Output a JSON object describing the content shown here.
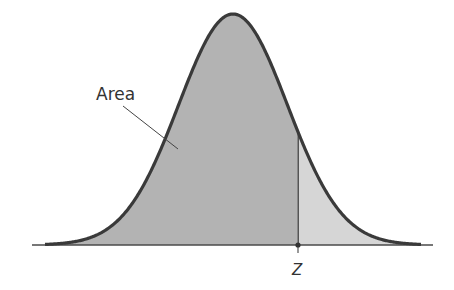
{
  "figure": {
    "type": "normal-distribution-diagram",
    "labels": {
      "area": "Area",
      "z": "Z"
    },
    "colors": {
      "curve": "#3a3a3a",
      "area_fill": "#b3b3b3",
      "tail_fill": "#d6d6d6",
      "axis": "#4a4a4a",
      "background": "#ffffff"
    }
  },
  "chart_data": {
    "type": "area",
    "title": "",
    "xlabel": "",
    "ylabel": "",
    "annotations": [
      {
        "text": "Area",
        "points_to": "shaded region left of Z"
      },
      {
        "text": "Z",
        "position": "x-axis, about 1.2 standard deviations right of mean"
      }
    ],
    "z_position_sd": 1.2,
    "grid": false,
    "legend": null
  }
}
